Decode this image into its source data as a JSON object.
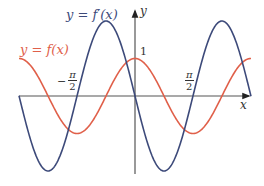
{
  "chart_data": {
    "type": "line",
    "title": "",
    "xlabel": "x",
    "ylabel": "y",
    "grid": false,
    "legend_position": "inline-labels",
    "xlim": [
      -3.14,
      3.14
    ],
    "ylim": [
      -2.1,
      2.2
    ],
    "x_ticks": [
      {
        "value": -1.5708,
        "label": "-π/2"
      },
      {
        "value": 1.5708,
        "label": "π/2"
      }
    ],
    "y_ticks": [
      {
        "value": 1,
        "label": "1"
      }
    ],
    "series": [
      {
        "name": "y = f(x)",
        "color": "#e0604a",
        "expression": "cos(2x)",
        "amplitude": 1,
        "period": 3.1416
      },
      {
        "name": "y = f'(x)",
        "color": "#3d4a7a",
        "expression": "-2 sin(2x)",
        "amplitude": 2,
        "period": 3.1416
      }
    ],
    "annotations": [
      "y = f'(x)",
      "y = f(x)",
      "1",
      "-π/2",
      "π/2"
    ]
  },
  "labels": {
    "fprime": "y = f′(x)",
    "f": "y = f(x)",
    "x_axis": "x",
    "y_axis": "y",
    "one": "1",
    "pi": "π",
    "two": "2",
    "minus": "−"
  },
  "colors": {
    "f": "#e0604a",
    "fprime": "#3d4a7a",
    "axis": "#333333"
  }
}
